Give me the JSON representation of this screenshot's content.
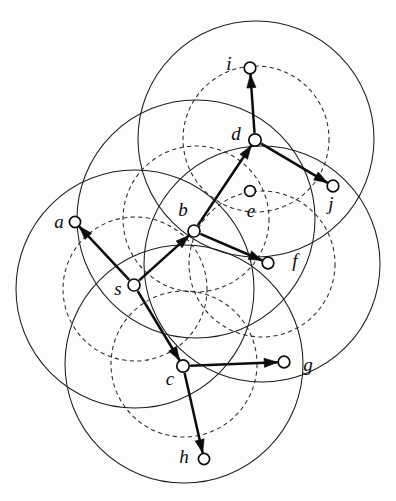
{
  "figure": {
    "width": 396,
    "height": 501,
    "background_color": "#fdfdfc",
    "stroke_color": "#0d0d0d"
  },
  "nodes": [
    {
      "id": "s",
      "label": "s",
      "x": 134,
      "y": 285,
      "r": 6.0,
      "label_x": 118,
      "label_y": 291
    },
    {
      "id": "a",
      "label": "a",
      "x": 75,
      "y": 222,
      "r": 5.6,
      "label_x": 59,
      "label_y": 224
    },
    {
      "id": "b",
      "label": "b",
      "x": 194,
      "y": 231,
      "r": 6.0,
      "label_x": 183,
      "label_y": 212
    },
    {
      "id": "c",
      "label": "c",
      "x": 183,
      "y": 366,
      "r": 6.2,
      "label_x": 170,
      "label_y": 381
    },
    {
      "id": "d",
      "label": "d",
      "x": 255,
      "y": 140,
      "r": 6.2,
      "label_x": 236,
      "label_y": 136
    },
    {
      "id": "e",
      "label": "e",
      "x": 250,
      "y": 191,
      "r": 5.4,
      "label_x": 251,
      "label_y": 213
    },
    {
      "id": "f",
      "label": "f",
      "x": 268,
      "y": 263,
      "r": 5.8,
      "label_x": 295,
      "label_y": 263
    },
    {
      "id": "g",
      "label": "g",
      "x": 284,
      "y": 362,
      "r": 5.8,
      "label_x": 308,
      "label_y": 367
    },
    {
      "id": "h",
      "label": "h",
      "x": 204,
      "y": 459,
      "r": 5.6,
      "label_x": 184,
      "label_y": 459
    },
    {
      "id": "i",
      "label": "i",
      "x": 250,
      "y": 68,
      "r": 5.8,
      "label_x": 229,
      "label_y": 66
    },
    {
      "id": "j",
      "label": "j",
      "x": 333,
      "y": 186,
      "r": 5.8,
      "label_x": 331,
      "label_y": 206
    }
  ],
  "edges": [
    {
      "from": "s",
      "to": "a",
      "directed": true
    },
    {
      "from": "s",
      "to": "b",
      "directed": true
    },
    {
      "from": "s",
      "to": "c",
      "directed": true
    },
    {
      "from": "b",
      "to": "d",
      "directed": true
    },
    {
      "from": "b",
      "to": "f",
      "directed": true
    },
    {
      "from": "d",
      "to": "i",
      "directed": true
    },
    {
      "from": "d",
      "to": "j",
      "directed": true
    },
    {
      "from": "c",
      "to": "g",
      "directed": true
    },
    {
      "from": "c",
      "to": "h",
      "directed": true
    }
  ],
  "range_circles_solid": [
    {
      "center": "d",
      "cx": 256,
      "cy": 139,
      "r": 118
    },
    {
      "center": "b",
      "cx": 196,
      "cy": 219,
      "r": 119
    },
    {
      "center": "s",
      "cx": 135,
      "cy": 289,
      "r": 119
    },
    {
      "center": "c",
      "cx": 184,
      "cy": 364,
      "r": 119
    },
    {
      "center": "f",
      "cx": 262,
      "cy": 264,
      "r": 118
    }
  ],
  "range_circles_dashed": [
    {
      "center": "d",
      "cx": 256,
      "cy": 139,
      "r": 73
    },
    {
      "center": "b",
      "cx": 196,
      "cy": 219,
      "r": 73
    },
    {
      "center": "s",
      "cx": 135,
      "cy": 289,
      "r": 72
    },
    {
      "center": "c",
      "cx": 184,
      "cy": 364,
      "r": 73
    },
    {
      "center": "f",
      "cx": 262,
      "cy": 264,
      "r": 73
    }
  ],
  "style": {
    "solid_stroke": "#1d1d1d",
    "dashed_stroke": "#2a2a2a",
    "edge_stroke": "#0c0c0c",
    "node_fill": "#ffffff"
  }
}
